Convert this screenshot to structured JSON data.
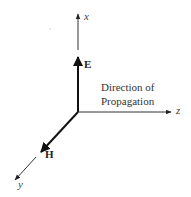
{
  "diagram": {
    "axes": {
      "x": "x",
      "y": "y",
      "z": "z"
    },
    "vectors": {
      "E": "E",
      "H": "H"
    },
    "annotation": {
      "line1": "Direction of",
      "line2": "Propagation"
    },
    "colors": {
      "line": "#222222",
      "background": "#ffffff"
    }
  }
}
